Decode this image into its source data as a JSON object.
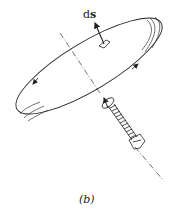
{
  "figure": {
    "caption": "(b)",
    "vector_label_d": "d",
    "vector_label_s": "s",
    "elements": [
      "tilted elliptical loop with circulation arrows",
      "area element ds with normal vector arrow",
      "dash-dot axis normal to loop",
      "right-hand screw with rotation arrow"
    ]
  },
  "colors": {
    "stroke": "#222222",
    "background": "#ffffff"
  }
}
